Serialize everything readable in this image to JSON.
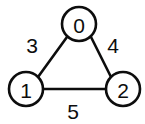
{
  "figure": {
    "type": "weighted-undirected-graph",
    "background_color": "#ffffff",
    "stroke_color": "#0d0d0d"
  },
  "chart_data": {
    "type": "diagram",
    "title": "",
    "nodes": [
      {
        "id": "0",
        "label": "0",
        "cx": 79,
        "cy": 24,
        "r": 17
      },
      {
        "id": "1",
        "label": "1",
        "cx": 26,
        "cy": 89,
        "r": 17
      },
      {
        "id": "2",
        "label": "2",
        "cx": 123,
        "cy": 89,
        "r": 17
      }
    ],
    "edges": [
      {
        "source": "0",
        "target": "1",
        "weight": "3",
        "x1": 67,
        "y1": 37,
        "x2": 38,
        "y2": 77,
        "label_x": 32,
        "label_y": 45
      },
      {
        "source": "0",
        "target": "2",
        "weight": "4",
        "x1": 91,
        "y1": 37,
        "x2": 111,
        "y2": 77,
        "label_x": 113,
        "label_y": 45
      },
      {
        "source": "1",
        "target": "2",
        "weight": "5",
        "x1": 43,
        "y1": 89,
        "x2": 106,
        "y2": 89,
        "label_x": 73,
        "label_y": 111
      }
    ]
  }
}
